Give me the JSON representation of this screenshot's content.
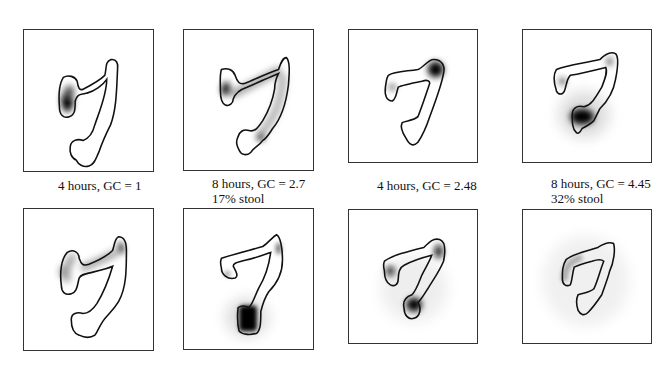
{
  "figure": {
    "panels": [
      {
        "id": "top-1",
        "row": "top",
        "column": 1,
        "caption_line1": "4 hours, GC = 1",
        "caption_line2": ""
      },
      {
        "id": "top-2",
        "row": "top",
        "column": 2,
        "caption_line1": "8 hours, GC = 2.7",
        "caption_line2": "17% stool"
      },
      {
        "id": "top-3",
        "row": "top",
        "column": 3,
        "caption_line1": "4 hours, GC = 2.48",
        "caption_line2": ""
      },
      {
        "id": "top-4",
        "row": "top",
        "column": 4,
        "caption_line1": "8 hours, GC = 4.45",
        "caption_line2": "32% stool"
      },
      {
        "id": "bottom-1",
        "row": "bottom",
        "column": 1
      },
      {
        "id": "bottom-2",
        "row": "bottom",
        "column": 2
      },
      {
        "id": "bottom-3",
        "row": "bottom",
        "column": 3
      },
      {
        "id": "bottom-4",
        "row": "bottom",
        "column": 4
      }
    ],
    "colors": {
      "outline": "#111111",
      "activity": "#000000",
      "frame": "#333333",
      "background": "#ffffff"
    }
  }
}
